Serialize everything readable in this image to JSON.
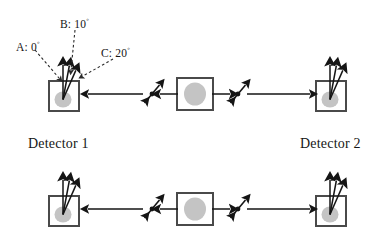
{
  "figure": {
    "type": "physics-diagram",
    "background_color": "#ffffff",
    "stroke_color": "#1a1a1a",
    "box_border_color": "#4a4a4a",
    "blob_fill_color": "#c4c4c4",
    "dashed_leader_color": "#2b2b2b",
    "width": 390,
    "height": 247
  },
  "angle_labels": [
    {
      "id": "A",
      "text": "A: 0",
      "degree_symbol": "◦",
      "value": 0,
      "unit": "degrees",
      "full": "A: 0°"
    },
    {
      "id": "B",
      "text": "B: 10",
      "degree_symbol": "◦",
      "value": 10,
      "unit": "degrees",
      "full": "B: 10°"
    },
    {
      "id": "C",
      "text": "C: 20",
      "degree_symbol": "◦",
      "value": 20,
      "unit": "degrees",
      "full": "C: 20°"
    }
  ],
  "captions": {
    "detector_1": "Detector 1",
    "detector_2": "Detector 2"
  },
  "rows": [
    {
      "id": "row-top",
      "has_angle_labels": true,
      "has_captions": true,
      "left_detector": {
        "name": "detector-1",
        "analyzer_arrows": 3
      },
      "right_detector": {
        "name": "detector-2",
        "analyzer_arrows": 3
      },
      "source": {
        "name": "particle-source",
        "emits": 2
      },
      "particles": [
        {
          "name": "particle-left",
          "travel": "left"
        },
        {
          "name": "particle-right",
          "travel": "right"
        }
      ]
    },
    {
      "id": "row-bottom",
      "has_angle_labels": false,
      "has_captions": false,
      "left_detector": {
        "name": "detector-1",
        "analyzer_arrows": 3
      },
      "right_detector": {
        "name": "detector-2",
        "analyzer_arrows": 3
      },
      "source": {
        "name": "particle-source",
        "emits": 2
      },
      "particles": [
        {
          "name": "particle-left",
          "travel": "left"
        },
        {
          "name": "particle-right",
          "travel": "right"
        }
      ]
    }
  ]
}
